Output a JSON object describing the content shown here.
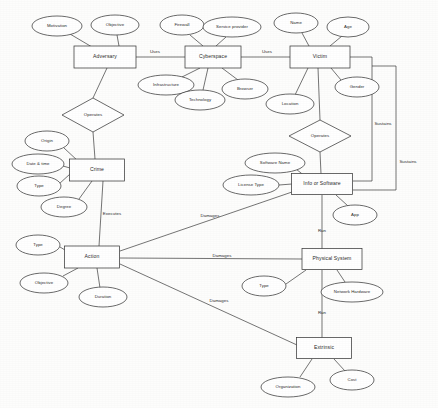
{
  "diagram": {
    "kind": "entity-relationship-diagram",
    "stroke_color": "#3a3a3a",
    "fill_color": "#ffffff",
    "text_color": "#2b2b2b",
    "background_color": "#fdfdfc",
    "entities": [
      {
        "id": "adversary",
        "label": "Adversary",
        "x": 105,
        "y": 57,
        "w": 62,
        "h": 22
      },
      {
        "id": "cyberspace",
        "label": "Cyberspace",
        "x": 213,
        "y": 57,
        "w": 56,
        "h": 22
      },
      {
        "id": "victim",
        "label": "Victim",
        "x": 320,
        "y": 57,
        "w": 60,
        "h": 22
      },
      {
        "id": "crime",
        "label": "Crime",
        "x": 97,
        "y": 170,
        "w": 55,
        "h": 22
      },
      {
        "id": "action",
        "label": "Action",
        "x": 92,
        "y": 257,
        "w": 55,
        "h": 22
      },
      {
        "id": "info",
        "label": "Info or Software",
        "x": 322,
        "y": 184,
        "w": 61,
        "h": 21
      },
      {
        "id": "physical",
        "label": "Physical System",
        "x": 332,
        "y": 259,
        "w": 60,
        "h": 21
      },
      {
        "id": "extrinsic",
        "label": "Extrinsic",
        "x": 324,
        "y": 348,
        "w": 55,
        "h": 21
      }
    ],
    "relationships": [
      {
        "id": "operates-crime",
        "label": "Operates",
        "x": 93,
        "y": 115,
        "rx": 31,
        "ry": 17
      },
      {
        "id": "operates-info",
        "label": "Operates",
        "x": 320,
        "y": 136,
        "rx": 31,
        "ry": 16
      }
    ],
    "attributes": [
      {
        "id": "motivation",
        "label": "Motivation",
        "x": 57,
        "y": 26,
        "rx": 25,
        "ry": 10,
        "owner": "adversary"
      },
      {
        "id": "objective-adv",
        "label": "Objective",
        "x": 115,
        "y": 25,
        "rx": 24,
        "ry": 10,
        "owner": "adversary"
      },
      {
        "id": "firewall",
        "label": "Firewall",
        "x": 182,
        "y": 25,
        "rx": 22,
        "ry": 10,
        "owner": "cyberspace"
      },
      {
        "id": "service-provider",
        "label": "Service provider",
        "x": 232,
        "y": 27,
        "rx": 29,
        "ry": 10,
        "owner": "cyberspace"
      },
      {
        "id": "name",
        "label": "Name",
        "x": 296,
        "y": 23,
        "rx": 22,
        "ry": 10,
        "owner": "victim"
      },
      {
        "id": "age",
        "label": "Age",
        "x": 348,
        "y": 27,
        "rx": 21,
        "ry": 10,
        "owner": "victim"
      },
      {
        "id": "infrastructure",
        "label": "Infrastructure",
        "x": 166,
        "y": 85,
        "rx": 28,
        "ry": 10,
        "owner": "cyberspace"
      },
      {
        "id": "technology",
        "label": "Technology",
        "x": 200,
        "y": 100,
        "rx": 25,
        "ry": 10,
        "owner": "cyberspace"
      },
      {
        "id": "browser",
        "label": "Browser",
        "x": 245,
        "y": 89,
        "rx": 23,
        "ry": 10,
        "owner": "cyberspace"
      },
      {
        "id": "location",
        "label": "Location",
        "x": 290,
        "y": 104,
        "rx": 24,
        "ry": 10,
        "owner": "victim"
      },
      {
        "id": "gender",
        "label": "Gender",
        "x": 357,
        "y": 87,
        "rx": 22,
        "ry": 10,
        "owner": "victim"
      },
      {
        "id": "origin",
        "label": "Origin",
        "x": 47,
        "y": 141,
        "rx": 22,
        "ry": 10,
        "owner": "crime"
      },
      {
        "id": "date-time",
        "label": "Date & time",
        "x": 38,
        "y": 164,
        "rx": 26,
        "ry": 10,
        "owner": "crime"
      },
      {
        "id": "type-crime",
        "label": "Type",
        "x": 39,
        "y": 186,
        "rx": 22,
        "ry": 10,
        "owner": "crime"
      },
      {
        "id": "degree",
        "label": "Degree",
        "x": 64,
        "y": 207,
        "rx": 23,
        "ry": 10,
        "owner": "crime"
      },
      {
        "id": "type-action",
        "label": "Type",
        "x": 38,
        "y": 245,
        "rx": 22,
        "ry": 10,
        "owner": "action"
      },
      {
        "id": "objective-action",
        "label": "Objective",
        "x": 44,
        "y": 283,
        "rx": 24,
        "ry": 10,
        "owner": "action"
      },
      {
        "id": "duration",
        "label": "Duration",
        "x": 103,
        "y": 297,
        "rx": 24,
        "ry": 10,
        "owner": "action"
      },
      {
        "id": "software-name",
        "label": "Software Name",
        "x": 275,
        "y": 163,
        "rx": 30,
        "ry": 10,
        "owner": "info"
      },
      {
        "id": "license-type",
        "label": "License Type",
        "x": 251,
        "y": 185,
        "rx": 28,
        "ry": 10,
        "owner": "info"
      },
      {
        "id": "app",
        "label": "App",
        "x": 355,
        "y": 215,
        "rx": 22,
        "ry": 10,
        "owner": "info"
      },
      {
        "id": "type-physical",
        "label": "Type",
        "x": 264,
        "y": 286,
        "rx": 22,
        "ry": 10,
        "owner": "physical"
      },
      {
        "id": "network-hardware",
        "label": "Network Hardware",
        "x": 352,
        "y": 292,
        "rx": 31,
        "ry": 10,
        "owner": "physical"
      },
      {
        "id": "organization",
        "label": "Organization",
        "x": 288,
        "y": 387,
        "rx": 27,
        "ry": 10,
        "owner": "extrinsic"
      },
      {
        "id": "cost",
        "label": "Cost",
        "x": 352,
        "y": 380,
        "rx": 22,
        "ry": 10,
        "owner": "extrinsic"
      }
    ],
    "edge_labels": [
      {
        "id": "uses-adv-cyber",
        "label": "Uses",
        "x": 155,
        "y": 52
      },
      {
        "id": "uses-cyber-victim",
        "label": "Uses",
        "x": 267,
        "y": 52
      },
      {
        "id": "executes",
        "label": "Executes",
        "x": 112,
        "y": 214
      },
      {
        "id": "sustains-upper",
        "label": "Sustains",
        "x": 383,
        "y": 124
      },
      {
        "id": "sustains-lower",
        "label": "Sustains",
        "x": 408,
        "y": 162
      },
      {
        "id": "damages-info",
        "label": "Damages",
        "x": 210,
        "y": 216
      },
      {
        "id": "damages-physical",
        "label": "Damages",
        "x": 222,
        "y": 256
      },
      {
        "id": "damages-extrinsic",
        "label": "Damages",
        "x": 219,
        "y": 301
      },
      {
        "id": "run-info-physical",
        "label": "Run",
        "x": 322,
        "y": 231
      },
      {
        "id": "run-physical-extr",
        "label": "Run",
        "x": 322,
        "y": 313
      }
    ]
  }
}
